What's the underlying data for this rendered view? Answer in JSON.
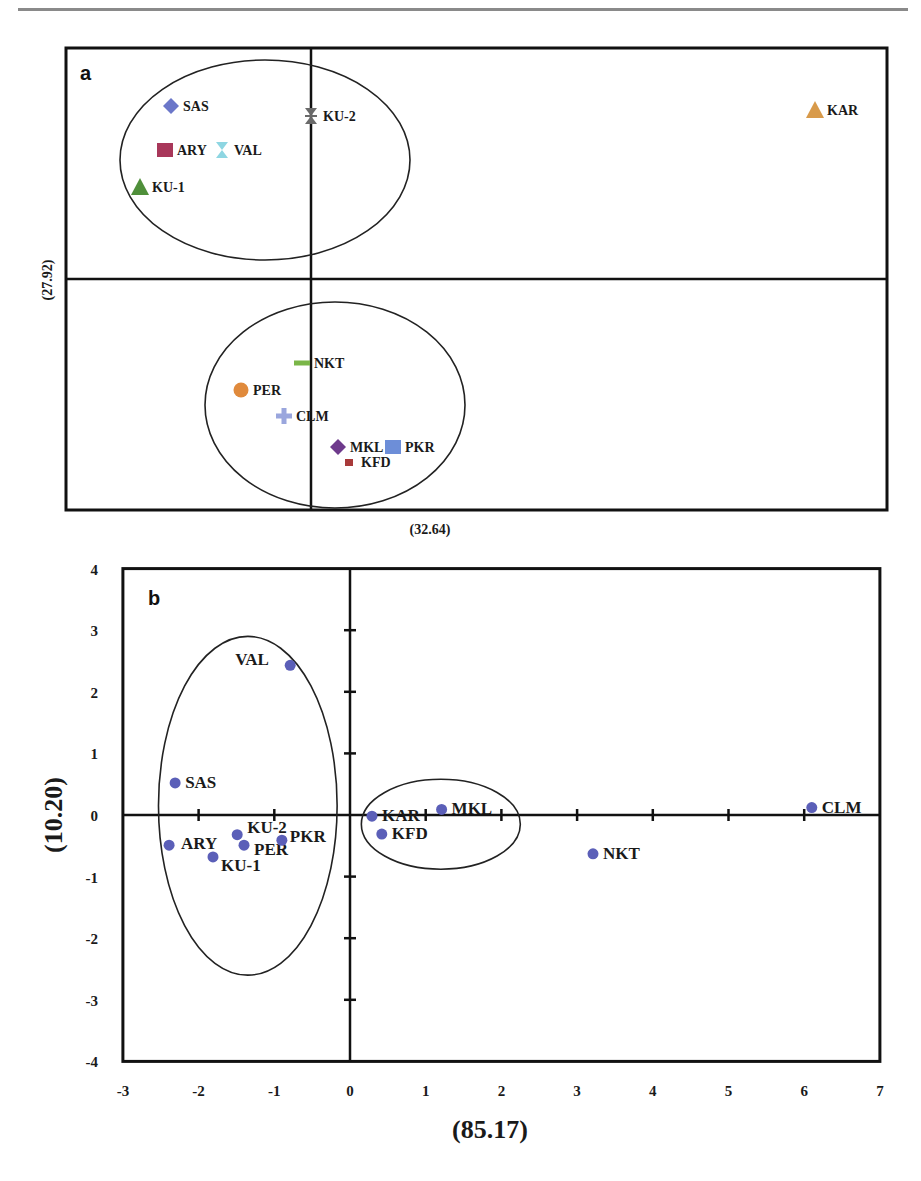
{
  "chart_data": [
    {
      "panel": "a",
      "type": "scatter",
      "title": "",
      "xlabel": "(32.64)",
      "ylabel": "(27.92)",
      "axis_ticks": "none",
      "grid": false,
      "frame_px": {
        "left": 66,
        "top": 48,
        "right": 887,
        "bottom": 510
      },
      "origin_px": {
        "x": 311,
        "y": 279
      },
      "points": [
        {
          "label": "SAS",
          "marker": "diamond",
          "color": "#6b77c9",
          "px": [
            171,
            106
          ]
        },
        {
          "label": "KU-2",
          "marker": "x-star",
          "color": "#6a6a6a",
          "px": [
            311,
            116
          ]
        },
        {
          "label": "ARY",
          "marker": "square",
          "color": "#a8375a",
          "px": [
            165,
            150
          ]
        },
        {
          "label": "VAL",
          "marker": "hourglass",
          "color": "#8ed6e2",
          "px": [
            222,
            150
          ]
        },
        {
          "label": "KU-1",
          "marker": "triangle",
          "color": "#4f8f3a",
          "px": [
            140,
            187
          ]
        },
        {
          "label": "KAR",
          "marker": "triangle",
          "color": "#d89a4a",
          "px": [
            815,
            110
          ]
        },
        {
          "label": "NKT",
          "marker": "dash",
          "color": "#7ab648",
          "px": [
            302,
            363
          ]
        },
        {
          "label": "PER",
          "marker": "circle",
          "color": "#e08a3c",
          "px": [
            241,
            390
          ]
        },
        {
          "label": "CLM",
          "marker": "cross",
          "color": "#9aa6dd",
          "px": [
            284,
            416
          ]
        },
        {
          "label": "MKL",
          "marker": "diamond",
          "color": "#6e3a8c",
          "px": [
            338,
            447
          ]
        },
        {
          "label": "PKR",
          "marker": "square",
          "color": "#6d8ed8",
          "px": [
            393,
            447
          ]
        },
        {
          "label": "KFD",
          "marker": "small-square",
          "color": "#a83a3a",
          "px": [
            349,
            462
          ]
        }
      ],
      "ellipses_px": [
        {
          "cx": 265,
          "cy": 160,
          "rx": 145,
          "ry": 100
        },
        {
          "cx": 335,
          "cy": 405,
          "rx": 130,
          "ry": 103
        }
      ],
      "panel_label": "a"
    },
    {
      "panel": "b",
      "type": "scatter",
      "title": "",
      "xlabel": "(85.17)",
      "ylabel": "(10.20)",
      "xlim": [
        -3,
        7
      ],
      "ylim": [
        -4,
        4
      ],
      "xticks": [
        -3,
        -2,
        -1,
        0,
        1,
        2,
        3,
        4,
        5,
        6,
        7
      ],
      "yticks": [
        4,
        3,
        2,
        1,
        0,
        -1,
        -2,
        -3,
        -4
      ],
      "grid": false,
      "marker_color": "#5b5fb8",
      "points": [
        {
          "label": "VAL",
          "x": -0.79,
          "y": 2.43
        },
        {
          "label": "SAS",
          "x": -2.31,
          "y": 0.52
        },
        {
          "label": "ARY",
          "x": -2.39,
          "y": -0.49
        },
        {
          "label": "KU-2",
          "x": -1.49,
          "y": -0.32
        },
        {
          "label": "PER",
          "x": -1.4,
          "y": -0.49
        },
        {
          "label": "PKR",
          "x": -0.9,
          "y": -0.41
        },
        {
          "label": "KU-1",
          "x": -1.81,
          "y": -0.68
        },
        {
          "label": "KAR",
          "x": 0.29,
          "y": -0.02
        },
        {
          "label": "KFD",
          "x": 0.42,
          "y": -0.31
        },
        {
          "label": "MKL",
          "x": 1.21,
          "y": 0.09
        },
        {
          "label": "NKT",
          "x": 3.21,
          "y": -0.63
        },
        {
          "label": "CLM",
          "x": 6.1,
          "y": 0.12
        }
      ],
      "ellipses_data": [
        {
          "cx": -1.35,
          "cy": 0.15,
          "rx": 1.18,
          "ry": 2.75
        },
        {
          "cx": 1.2,
          "cy": -0.15,
          "rx": 1.05,
          "ry": 0.73
        }
      ],
      "panel_label": "b"
    }
  ]
}
